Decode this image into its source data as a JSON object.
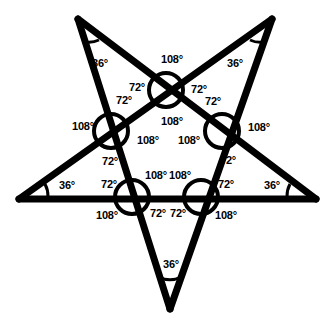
{
  "figure": {
    "shape": "five-pointed-star",
    "stroke_color": "#000000",
    "background_color": "#ffffff",
    "degree_symbol": "°"
  },
  "geometry": {
    "outer_points": [
      {
        "name": "top-left-point",
        "x": 78,
        "y": 19
      },
      {
        "name": "top-right-point",
        "x": 272,
        "y": 19
      },
      {
        "name": "right-point",
        "x": 316,
        "y": 199
      },
      {
        "name": "bottom-point",
        "x": 170,
        "y": 309
      },
      {
        "name": "left-point",
        "x": 19,
        "y": 199
      }
    ],
    "crossing_nodes": [
      {
        "name": "top-node",
        "x": 166,
        "y": 90
      },
      {
        "name": "left-node",
        "x": 111,
        "y": 131
      },
      {
        "name": "right-node",
        "x": 222,
        "y": 131
      },
      {
        "name": "bottom-left-node",
        "x": 132,
        "y": 197
      },
      {
        "name": "bottom-right-node",
        "x": 201,
        "y": 197
      }
    ],
    "node_circle_radius": 17
  },
  "labels": {
    "tips": [
      {
        "id": "tip-top-left",
        "text": "36°",
        "x": 100,
        "y": 63
      },
      {
        "id": "tip-top-right",
        "text": "36°",
        "x": 235,
        "y": 63
      },
      {
        "id": "tip-left",
        "text": "36°",
        "x": 67,
        "y": 185
      },
      {
        "id": "tip-right",
        "text": "36°",
        "x": 272,
        "y": 185
      },
      {
        "id": "tip-bottom",
        "text": "36°",
        "x": 171,
        "y": 264
      }
    ],
    "top_node": [
      {
        "id": "top-node-outer",
        "text": "108°",
        "x": 172,
        "y": 59
      },
      {
        "id": "top-node-left",
        "text": "72°",
        "x": 137,
        "y": 87
      },
      {
        "id": "top-node-right",
        "text": "72°",
        "x": 199,
        "y": 89
      },
      {
        "id": "top-node-inner",
        "text": "108°",
        "x": 172,
        "y": 121
      }
    ],
    "left_node": [
      {
        "id": "left-node-outer",
        "text": "108°",
        "x": 83,
        "y": 126
      },
      {
        "id": "left-node-upper",
        "text": "72°",
        "x": 124,
        "y": 100
      },
      {
        "id": "left-node-lower",
        "text": "72°",
        "x": 110,
        "y": 161
      },
      {
        "id": "left-node-inner",
        "text": "108°",
        "x": 148,
        "y": 140
      }
    ],
    "right_node": [
      {
        "id": "right-node-outer",
        "text": "108°",
        "x": 259,
        "y": 127
      },
      {
        "id": "right-node-upper",
        "text": "72°",
        "x": 213,
        "y": 101
      },
      {
        "id": "right-node-lower",
        "text": "72°",
        "x": 228,
        "y": 160
      },
      {
        "id": "right-node-inner",
        "text": "108°",
        "x": 189,
        "y": 140
      }
    ],
    "bottom_left_node": [
      {
        "id": "bottom-left-node-outer",
        "text": "108°",
        "x": 107,
        "y": 215
      },
      {
        "id": "bottom-left-node-upper",
        "text": "72°",
        "x": 109,
        "y": 184
      },
      {
        "id": "bottom-left-node-inner",
        "text": "108°",
        "x": 156,
        "y": 175
      },
      {
        "id": "bottom-left-node-lower",
        "text": "72°",
        "x": 158,
        "y": 213
      }
    ],
    "bottom_right_node": [
      {
        "id": "bottom-right-node-outer",
        "text": "108°",
        "x": 226,
        "y": 215
      },
      {
        "id": "bottom-right-node-upper",
        "text": "72°",
        "x": 226,
        "y": 184
      },
      {
        "id": "bottom-right-node-inner",
        "text": "108°",
        "x": 180,
        "y": 175
      },
      {
        "id": "bottom-right-node-lower",
        "text": "72°",
        "x": 178,
        "y": 213
      }
    ]
  }
}
